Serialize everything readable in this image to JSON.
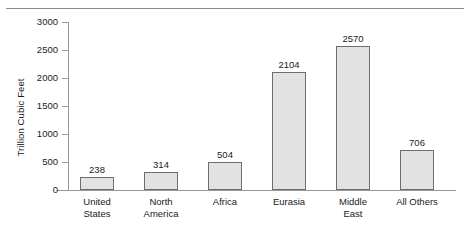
{
  "chart_data": {
    "type": "bar",
    "title": "",
    "subtitle": "",
    "xlabel": "",
    "ylabel": "Trillion Cubic Feet",
    "categories": [
      "United States",
      "North America",
      "Africa",
      "Eurasia",
      "Middle East",
      "All Others"
    ],
    "category_lines": [
      [
        "United",
        "States"
      ],
      [
        "North",
        "America"
      ],
      [
        "Africa"
      ],
      [
        "Eurasia"
      ],
      [
        "Middle",
        "East"
      ],
      [
        "All Others"
      ]
    ],
    "values": [
      238,
      314,
      504,
      2104,
      2570,
      706
    ],
    "value_labels": [
      "238",
      "314",
      "504",
      "2104",
      "2570",
      "706"
    ],
    "ylim": [
      0,
      3000
    ],
    "yticks": [
      0,
      500,
      1000,
      1500,
      2000,
      2500,
      3000
    ],
    "ytick_labels": [
      "0",
      "500",
      "1000",
      "1500",
      "2000",
      "2500",
      "3000"
    ],
    "grid": false,
    "legend": null,
    "legend_position": "none",
    "bar_fill_color": "#e2e2e2",
    "bar_edge_color": "#6e6e6e",
    "axis_color": "#999999",
    "background_color": "#ffffff"
  }
}
